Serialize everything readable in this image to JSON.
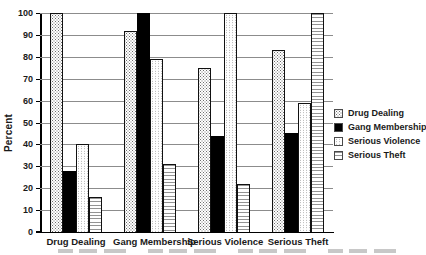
{
  "chart_data": {
    "type": "bar",
    "title": "",
    "xlabel": "",
    "ylabel": "Percent",
    "ylim": [
      0,
      100
    ],
    "ytick_step": 10,
    "grid": true,
    "legend_position": "right",
    "categories": [
      "Drug Dealing",
      "Gang Membership",
      "Serious Violence",
      "Serious Theft"
    ],
    "series": [
      {
        "name": "Drug Dealing",
        "pattern": "dots-dark",
        "values": [
          100,
          92,
          75,
          83
        ]
      },
      {
        "name": "Gang Membership",
        "pattern": "solid-black",
        "values": [
          28,
          100,
          44,
          45
        ]
      },
      {
        "name": "Serious Violence",
        "pattern": "dots-light",
        "values": [
          40,
          79,
          100,
          59
        ]
      },
      {
        "name": "Serious Theft",
        "pattern": "hlines",
        "values": [
          16,
          31,
          22,
          100
        ]
      }
    ],
    "colors": {
      "background": "#ffffff",
      "gridline": "#8c8c8c",
      "axis": "#000000",
      "bar_border": "#111111",
      "text": "#1a1a1a"
    }
  }
}
